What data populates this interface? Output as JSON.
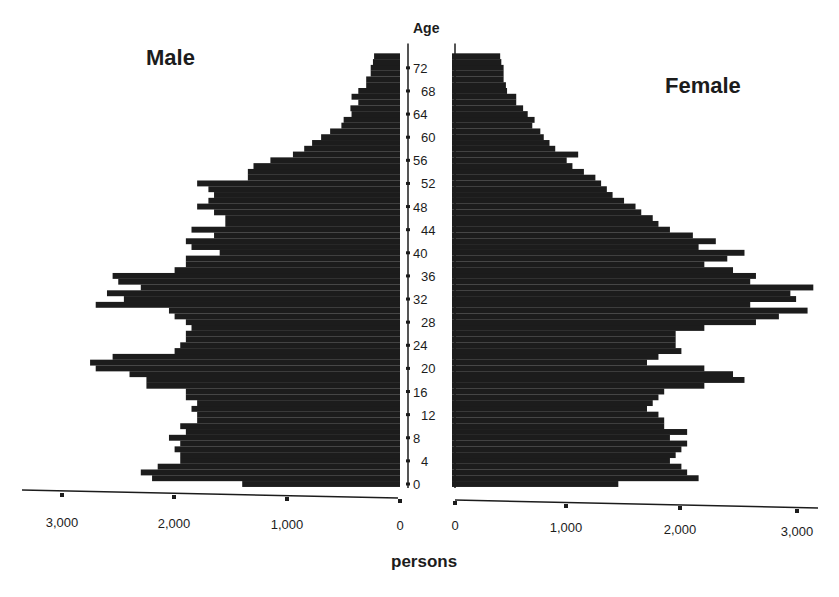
{
  "chart_data": {
    "type": "bar",
    "orientation": "horizontal",
    "subtype": "population-pyramid",
    "title": "",
    "side_labels": {
      "left": "Male",
      "right": "Female"
    },
    "ylabel": "Age",
    "xlabel": "persons",
    "x_ticks": {
      "male": [
        "3,000",
        "2,000",
        "1,000",
        "0"
      ],
      "female": [
        "0",
        "1,000",
        "2,000",
        "3,000"
      ]
    },
    "x_tick_values": [
      0,
      1000,
      2000,
      3000
    ],
    "xlim": [
      0,
      3200
    ],
    "y_ticks": [
      "0",
      "4",
      "8",
      "12",
      "16",
      "20",
      "24",
      "28",
      "32",
      "36",
      "40",
      "44",
      "48",
      "52",
      "56",
      "60",
      "64",
      "68",
      "72"
    ],
    "ylim": [
      0,
      74
    ],
    "grid": false,
    "legend": "none",
    "bar_color": "#1c1c1c",
    "ages": [
      0,
      1,
      2,
      3,
      4,
      5,
      6,
      7,
      8,
      9,
      10,
      11,
      12,
      13,
      14,
      15,
      16,
      17,
      18,
      19,
      20,
      21,
      22,
      23,
      24,
      25,
      26,
      27,
      28,
      29,
      30,
      31,
      32,
      33,
      34,
      35,
      36,
      37,
      38,
      39,
      40,
      41,
      42,
      43,
      44,
      45,
      46,
      47,
      48,
      49,
      50,
      51,
      52,
      53,
      54,
      55,
      56,
      57,
      58,
      59,
      60,
      61,
      62,
      63,
      64,
      65,
      66,
      67,
      68,
      69,
      70,
      71,
      72,
      73,
      74
    ],
    "series": [
      {
        "name": "Male",
        "values": [
          1400,
          2200,
          2300,
          2150,
          1950,
          1950,
          2000,
          1950,
          2050,
          1900,
          1950,
          1800,
          1800,
          1850,
          1800,
          1900,
          1900,
          2250,
          2250,
          2400,
          2700,
          2750,
          2550,
          2000,
          1950,
          1900,
          1900,
          1850,
          1900,
          2000,
          2050,
          2700,
          2450,
          2600,
          2300,
          2500,
          2550,
          2000,
          1900,
          1900,
          1600,
          1850,
          1900,
          1650,
          1850,
          1550,
          1550,
          1650,
          1800,
          1700,
          1650,
          1700,
          1800,
          1350,
          1350,
          1300,
          1150,
          950,
          850,
          780,
          700,
          620,
          520,
          500,
          430,
          440,
          370,
          430,
          370,
          300,
          300,
          260,
          260,
          240,
          230
        ]
      },
      {
        "name": "Female",
        "values": [
          1450,
          2150,
          2050,
          2000,
          1900,
          1950,
          2000,
          2050,
          1900,
          2050,
          1850,
          1850,
          1800,
          1700,
          1750,
          1800,
          1850,
          2200,
          2550,
          2450,
          2200,
          1700,
          1800,
          2000,
          1950,
          1950,
          1950,
          2200,
          2650,
          2850,
          3100,
          2600,
          3000,
          2950,
          3150,
          2600,
          2650,
          2450,
          2200,
          2400,
          2550,
          2150,
          2300,
          2100,
          1900,
          1800,
          1750,
          1650,
          1600,
          1500,
          1400,
          1350,
          1300,
          1250,
          1150,
          1050,
          1000,
          1100,
          900,
          850,
          800,
          770,
          700,
          720,
          660,
          620,
          560,
          560,
          480,
          470,
          450,
          450,
          450,
          430,
          420
        ]
      }
    ]
  }
}
